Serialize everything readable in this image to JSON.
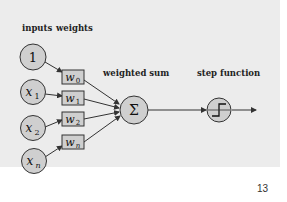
{
  "diagram": {
    "headers": {
      "inputs": "inputs",
      "weights": "weights",
      "weighted_sum": "weighted sum",
      "step_function": "step function"
    },
    "inputs": [
      {
        "label": "1",
        "sub": ""
      },
      {
        "label": "x",
        "sub": "1"
      },
      {
        "label": "x",
        "sub": "2"
      },
      {
        "label": "x",
        "sub": "n"
      }
    ],
    "weights": [
      {
        "label": "w",
        "sub": "0"
      },
      {
        "label": "w",
        "sub": "1"
      },
      {
        "label": "w",
        "sub": "2"
      },
      {
        "label": "w",
        "sub": "n"
      }
    ],
    "sum_symbol": "Σ",
    "colors": {
      "node_fill": "#cfcfcf",
      "stroke": "#333333",
      "background": "#ececec"
    }
  },
  "page": {
    "number": "13"
  }
}
